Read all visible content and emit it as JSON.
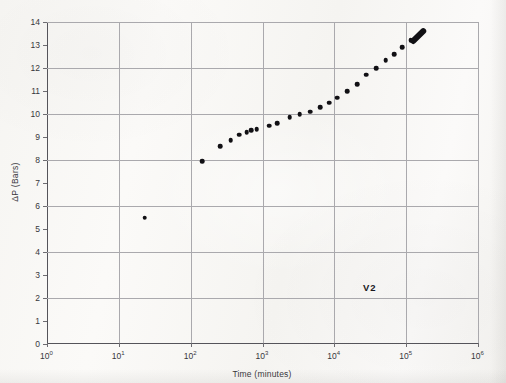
{
  "chart_data": {
    "type": "scatter",
    "title": "",
    "xlabel": "Time (minutes)",
    "ylabel": "ΔP (Bars)",
    "xscale": "log",
    "yscale": "linear",
    "xlim": [
      1,
      1000000
    ],
    "ylim": [
      0,
      14
    ],
    "grid": true,
    "legend": null,
    "annotations": [
      {
        "text": "V2",
        "x": 25000,
        "y": 2.7
      }
    ],
    "xtick_labels": [
      "10⁰",
      "10¹",
      "10²",
      "10³",
      "10⁴",
      "10⁵",
      "10⁶"
    ],
    "xtick_mantissas": [
      "10",
      "10",
      "10",
      "10",
      "10",
      "10",
      "10"
    ],
    "xtick_exponents": [
      "0",
      "1",
      "2",
      "3",
      "4",
      "5",
      "6"
    ],
    "ytick_labels": [
      "0",
      "1",
      "2",
      "3",
      "4",
      "5",
      "6",
      "7",
      "8",
      "9",
      "10",
      "11",
      "12",
      "13",
      "14"
    ],
    "ytick_values": [
      0,
      1,
      2,
      3,
      4,
      5,
      6,
      7,
      8,
      9,
      10,
      11,
      12,
      13,
      14
    ],
    "gridline_y_values": [
      0,
      2,
      4,
      6,
      8,
      10,
      12,
      14
    ],
    "gridline_x_values": [
      1,
      10,
      100,
      1000,
      10000,
      100000,
      1000000
    ],
    "series": [
      {
        "name": "V2",
        "marker": "filled-circle",
        "color": "#111014",
        "points": [
          {
            "x": 23,
            "y": 5.5
          },
          {
            "x": 145,
            "y": 7.95
          },
          {
            "x": 260,
            "y": 8.6
          },
          {
            "x": 360,
            "y": 8.85
          },
          {
            "x": 470,
            "y": 9.1
          },
          {
            "x": 600,
            "y": 9.2
          },
          {
            "x": 700,
            "y": 9.3
          },
          {
            "x": 830,
            "y": 9.35
          },
          {
            "x": 1250,
            "y": 9.5
          },
          {
            "x": 1600,
            "y": 9.6
          },
          {
            "x": 2400,
            "y": 9.85
          },
          {
            "x": 3300,
            "y": 10.0
          },
          {
            "x": 4600,
            "y": 10.1
          },
          {
            "x": 6300,
            "y": 10.3
          },
          {
            "x": 8500,
            "y": 10.5
          },
          {
            "x": 11000,
            "y": 10.7
          },
          {
            "x": 15000,
            "y": 11.0
          },
          {
            "x": 21000,
            "y": 11.3
          },
          {
            "x": 28000,
            "y": 11.7
          },
          {
            "x": 38000,
            "y": 12.0
          },
          {
            "x": 52000,
            "y": 12.35
          },
          {
            "x": 68000,
            "y": 12.6
          },
          {
            "x": 88000,
            "y": 12.9
          },
          {
            "x": 115000,
            "y": 13.2
          }
        ],
        "dense_cluster": {
          "x_start": 125000,
          "y_start": 13.15,
          "x_end": 175000,
          "y_end": 13.6,
          "note": "overlapping points merged into a short diagonal streak"
        }
      }
    ]
  },
  "style": {
    "paper_color": "#faf9f7",
    "axis_color": "#55545a",
    "grid_color": "#aaa9ad",
    "marker_color": "#111014",
    "text_color": "#37363b"
  }
}
